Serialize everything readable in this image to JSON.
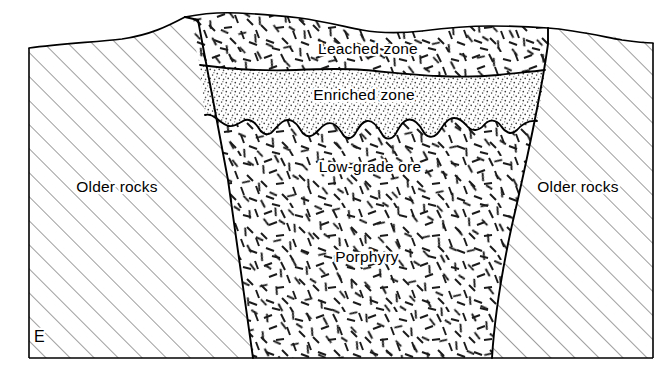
{
  "figure": {
    "type": "geologic-cross-section",
    "title_visible": false,
    "corner_label": "E",
    "background_color": "#ffffff",
    "line_color": "#000000",
    "frame": {
      "left": 29,
      "top": 15,
      "right": 653,
      "bottom": 358
    }
  },
  "labels": {
    "leached_zone": "Leached zone",
    "enriched_zone": "Enriched zone",
    "low_grade_ore": "Low-grade ore",
    "porphyry": "Porphyry",
    "older_rocks_left": "Older rocks",
    "older_rocks_right": "Older rocks"
  },
  "label_positions": {
    "leached_zone": {
      "x": 368,
      "y": 50
    },
    "enriched_zone": {
      "x": 364,
      "y": 96
    },
    "low_grade_ore": {
      "x": 370,
      "y": 168
    },
    "porphyry": {
      "x": 367,
      "y": 258
    },
    "older_rocks_left": {
      "x": 117,
      "y": 188
    },
    "older_rocks_right": {
      "x": 578,
      "y": 188
    },
    "corner_label": {
      "x": 34,
      "y": 338
    }
  },
  "units": [
    {
      "id": "older-rocks-left",
      "name": "Older rocks",
      "pattern": "diagonal-hatch",
      "pattern_angle_deg": 45,
      "pattern_spacing_px": 17,
      "fill": "#ffffff"
    },
    {
      "id": "older-rocks-right",
      "name": "Older rocks",
      "pattern": "diagonal-hatch",
      "pattern_angle_deg": 45,
      "pattern_spacing_px": 17,
      "fill": "#ffffff"
    },
    {
      "id": "leached-zone",
      "name": "Leached zone",
      "pattern": "random-dashes",
      "fill": "#ffffff"
    },
    {
      "id": "enriched-zone",
      "name": "Enriched zone",
      "pattern": "stipple-dots",
      "fill": "#ffffff"
    },
    {
      "id": "porphyry-ore",
      "name": "Low-grade ore / Porphyry",
      "pattern": "random-dashes",
      "fill": "#ffffff"
    }
  ],
  "boundaries": [
    {
      "id": "ground-surface",
      "style": "solid",
      "description": "topographic surface across top of section"
    },
    {
      "id": "porphyry-left-contact",
      "style": "solid",
      "description": "intrusive contact, left side"
    },
    {
      "id": "porphyry-right-contact",
      "style": "solid",
      "description": "intrusive contact, right side"
    },
    {
      "id": "leached-enriched-boundary",
      "style": "undulating",
      "description": "base of leached zone"
    },
    {
      "id": "enriched-ore-boundary",
      "style": "irregular-wavy",
      "description": "base of supergene enriched blanket"
    }
  ]
}
